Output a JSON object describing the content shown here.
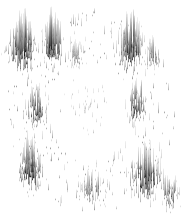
{
  "figure": {
    "title": "",
    "subtitle": "",
    "background_color": "#ffffff",
    "width_px": 185,
    "height_px": 223,
    "has_axes": false,
    "has_legend": false,
    "has_gridlines": false,
    "has_text_labels": false,
    "render_style": "vertical-needle-spikes",
    "spike_color_dark": "#1a1a1a",
    "spike_color_mid": "#6e6e6e",
    "spike_color_light": "#c8c8c8"
  },
  "chart_data": {
    "type": "scatter",
    "title": "",
    "subtitle": "",
    "xlabel": "",
    "ylabel": "",
    "xlim": [
      0,
      185
    ],
    "ylim": [
      0,
      223
    ],
    "grid": false,
    "legend_position": "none",
    "annotations": [],
    "tick_labels_x": [],
    "tick_labels_y": [],
    "marker_style": "vertical-line-impulse",
    "clusters": [
      {
        "name": "upper-left",
        "cx": 22,
        "cy": 52,
        "rx": 18,
        "ry": 26,
        "count": 150,
        "intensity": 0.95,
        "max_spike": 40
      },
      {
        "name": "upper-mid-left",
        "cx": 52,
        "cy": 50,
        "rx": 14,
        "ry": 24,
        "count": 110,
        "intensity": 0.9,
        "max_spike": 38
      },
      {
        "name": "upper-center",
        "cx": 76,
        "cy": 58,
        "rx": 12,
        "ry": 14,
        "count": 45,
        "intensity": 0.45,
        "max_spike": 16
      },
      {
        "name": "upper-right",
        "cx": 130,
        "cy": 52,
        "rx": 16,
        "ry": 26,
        "count": 130,
        "intensity": 0.92,
        "max_spike": 38
      },
      {
        "name": "upper-right-edge",
        "cx": 152,
        "cy": 58,
        "rx": 10,
        "ry": 16,
        "count": 45,
        "intensity": 0.55,
        "max_spike": 20
      },
      {
        "name": "mid-left",
        "cx": 36,
        "cy": 112,
        "rx": 13,
        "ry": 22,
        "count": 85,
        "intensity": 0.78,
        "max_spike": 28
      },
      {
        "name": "mid-right",
        "cx": 136,
        "cy": 108,
        "rx": 13,
        "ry": 24,
        "count": 85,
        "intensity": 0.78,
        "max_spike": 28
      },
      {
        "name": "center-sparse",
        "cx": 88,
        "cy": 108,
        "rx": 26,
        "ry": 30,
        "count": 22,
        "intensity": 0.18,
        "max_spike": 8
      },
      {
        "name": "lower-left",
        "cx": 30,
        "cy": 172,
        "rx": 16,
        "ry": 24,
        "count": 120,
        "intensity": 0.92,
        "max_spike": 36
      },
      {
        "name": "lower-center",
        "cx": 92,
        "cy": 192,
        "rx": 18,
        "ry": 18,
        "count": 60,
        "intensity": 0.6,
        "max_spike": 20
      },
      {
        "name": "lower-right",
        "cx": 146,
        "cy": 182,
        "rx": 20,
        "ry": 26,
        "count": 130,
        "intensity": 0.93,
        "max_spike": 40
      },
      {
        "name": "lower-right-edge",
        "cx": 170,
        "cy": 196,
        "rx": 12,
        "ry": 18,
        "count": 55,
        "intensity": 0.7,
        "max_spike": 24
      }
    ],
    "ring": {
      "center_x": 90,
      "center_y": 112,
      "outer_radius_x": 84,
      "outer_radius_y": 100,
      "inner_radius_x": 34,
      "inner_radius_y": 42,
      "total_points": 1400
    }
  }
}
